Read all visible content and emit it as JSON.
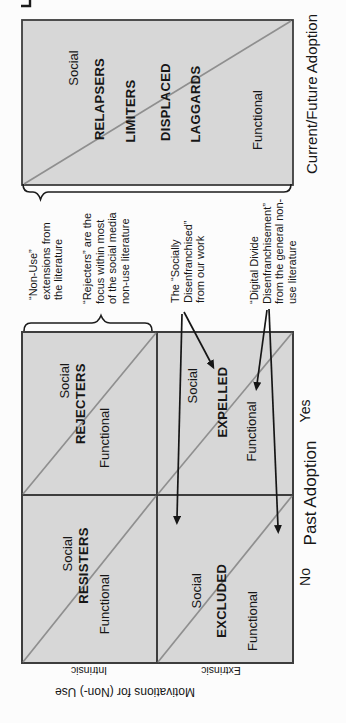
{
  "figure": {
    "title_hint": "Typology of technology non-use (scanned paper figure, rotated sideways)",
    "matrix": {
      "y_axis": {
        "label": "Motivations for (Non-) Use",
        "rows": [
          "Intrinsic",
          "Extrinsic"
        ]
      },
      "x_axis": {
        "label": "Past Adoption",
        "cols": [
          "No",
          "Yes"
        ]
      },
      "cells": [
        {
          "name": "RESISTERS",
          "motivation": "Intrinsic",
          "past_adoption": "No",
          "social": "Social",
          "functional": "Functional"
        },
        {
          "name": "REJECTERS",
          "motivation": "Intrinsic",
          "past_adoption": "Yes",
          "social": "Social",
          "functional": "Functional"
        },
        {
          "name": "EXCLUDED",
          "motivation": "Extrinsic",
          "past_adoption": "No",
          "social": "Social",
          "functional": "Functional"
        },
        {
          "name": "EXPELLED",
          "motivation": "Extrinsic",
          "past_adoption": "Yes",
          "social": "Social",
          "functional": "Functional"
        }
      ]
    },
    "spectrum": {
      "x_axis_label": "Current/Future Adoption",
      "social": "Social",
      "functional": "Functional",
      "categories": [
        "RELAPSERS",
        "LIMITERS",
        "DISPLACED",
        "LAGGARDS"
      ]
    },
    "annotations": [
      {
        "id": "non-use-extensions",
        "text": "“Non-Use”\nextensions from\nthe literature"
      },
      {
        "id": "rejecters-focus",
        "text": "“Rejecters” are the\nfocus within most\nof the social media\nnon-use literature"
      },
      {
        "id": "socially-disenfranchised",
        "text": "The “Socially\nDisenfranchised”\nfrom our work"
      },
      {
        "id": "digital-divide",
        "text": "“Digital Divide\nDisenfranchisement”\nfrom the general non-\nuse literature"
      }
    ],
    "colors": {
      "panel_fill": "#d7d7d7",
      "border": "#3d3d3d",
      "diagonal": "#8f8f8f",
      "ink": "#161616",
      "page": "#fcfcfc"
    }
  }
}
